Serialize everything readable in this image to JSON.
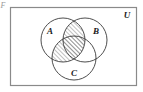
{
  "figure": {
    "corner_mark": "F",
    "universe_label": "U",
    "universe_label_name": "universal-set-label",
    "background_color": "#ffffff",
    "border_color": "#8a8a8a",
    "stroke_color": "#3a3a3a",
    "hatch_color": "#4a4a4a",
    "text_color": "#1a1a1a"
  },
  "sets": [
    {
      "id": "A",
      "label": "A",
      "cx": 63,
      "cy": 40,
      "r": 22,
      "label_x": 50,
      "label_y": 34
    },
    {
      "id": "B",
      "label": "B",
      "cx": 85,
      "cy": 40,
      "r": 22,
      "label_x": 95,
      "label_y": 34
    },
    {
      "id": "C",
      "label": "C",
      "cx": 74,
      "cy": 58,
      "r": 22,
      "label_x": 74,
      "label_y": 74
    }
  ],
  "rectangle": {
    "x": 10,
    "y": 7,
    "width": 127,
    "height": 79
  },
  "shading": {
    "pattern": "diagonal-hatch",
    "angle_degrees": 45,
    "spacing_px": 3,
    "shaded_regions": [
      "A-intersect-B-only",
      "A-intersect-B-intersect-C",
      "A-intersect-C-only"
    ],
    "unshaded_regions": [
      "A-only",
      "B-only",
      "C-only",
      "B-intersect-C-only",
      "outside-all-sets"
    ],
    "description": "Hatched region covers the intersection of A and B together with the intersection of A and C"
  }
}
